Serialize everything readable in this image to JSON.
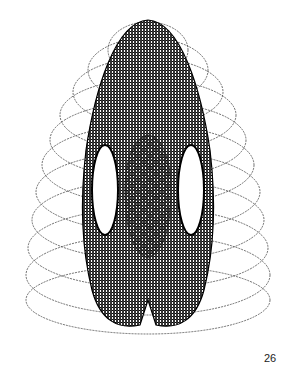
{
  "figure": {
    "ink_color": "#111111",
    "background": "#ffffff"
  },
  "page_number": "26"
}
